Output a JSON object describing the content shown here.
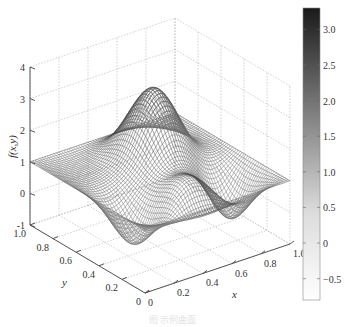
{
  "chart_data": {
    "type": "surface3d",
    "title": "",
    "xlabel": "x",
    "ylabel": "y",
    "zlabel": "f(x,y)",
    "x_ticks": [
      "0",
      "0.2",
      "0.4",
      "0.6",
      "0.8",
      "1.0"
    ],
    "y_ticks": [
      "0",
      "0.2",
      "0.4",
      "0.6",
      "0.8",
      "1.0"
    ],
    "z_ticks": [
      "-1",
      "0",
      "1",
      "2",
      "3",
      "4"
    ],
    "xlim": [
      0,
      1
    ],
    "ylim": [
      0,
      1
    ],
    "zlim": [
      -1,
      4
    ],
    "grid": true,
    "colormap": "gray (reversed: white = low, dark = high)",
    "colorbar": {
      "ticks": [
        "3.0",
        "2.5",
        "2.0",
        "1.5",
        "1.0",
        "0.5",
        "0",
        "-0.5"
      ],
      "tick_values": [
        3.0,
        2.5,
        2.0,
        1.5,
        1.0,
        0.5,
        0,
        -0.5
      ],
      "range": [
        -0.8,
        3.3
      ]
    },
    "surface_features": {
      "corner_value": 1.0,
      "main_peak": {
        "x": 0.6,
        "y": 0.7,
        "z": 3.3
      },
      "front_bump": {
        "x": 0.45,
        "y": 0.2,
        "z": 1.3
      },
      "minimum": -0.8
    }
  },
  "caption": "图 示例曲面"
}
